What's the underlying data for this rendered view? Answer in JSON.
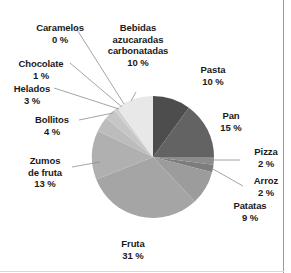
{
  "chart_data": {
    "type": "pie",
    "title": "",
    "subtitle": "",
    "xlabel": "",
    "ylabel": "",
    "legend_position": "none",
    "grid": false,
    "units": "%",
    "start_angle_deg": 0,
    "direction": "clockwise",
    "categories": [
      "Pasta",
      "Pan",
      "Pizza",
      "Arroz",
      "Patatas",
      "Fruta",
      "Zumos de fruta",
      "Bollitos",
      "Helados",
      "Chocolate",
      "Caramelos",
      "Bebidas azucaradas carbonatadas"
    ],
    "values": [
      10,
      15,
      2,
      2,
      9,
      31,
      13,
      4,
      3,
      1,
      0,
      10
    ],
    "colors": [
      "#4d4d4d",
      "#636363",
      "#8c8c8c",
      "#7d7d7d",
      "#9c9c9c",
      "#a5a5a5",
      "#b0b0b0",
      "#bcbcbc",
      "#c6c6c6",
      "#d0d0d0",
      "#dcdcdc",
      "#e8e8e8"
    ],
    "slices": [
      {
        "label": "Pasta",
        "value": 10,
        "display": "10 %",
        "color": "#4d4d4d"
      },
      {
        "label": "Pan",
        "value": 15,
        "display": "15 %",
        "color": "#636363"
      },
      {
        "label": "Pizza",
        "value": 2,
        "display": "2 %",
        "color": "#8c8c8c"
      },
      {
        "label": "Arroz",
        "value": 2,
        "display": "2 %",
        "color": "#7d7d7d"
      },
      {
        "label": "Patatas",
        "value": 9,
        "display": "9 %",
        "color": "#9c9c9c"
      },
      {
        "label": "Fruta",
        "value": 31,
        "display": "31 %",
        "color": "#a5a5a5"
      },
      {
        "label": "Zumos de fruta",
        "value": 13,
        "display": "13 %",
        "color": "#b0b0b0"
      },
      {
        "label": "Bollitos",
        "value": 4,
        "display": "4 %",
        "color": "#bcbcbc"
      },
      {
        "label": "Helados",
        "value": 3,
        "display": "3 %",
        "color": "#c6c6c6"
      },
      {
        "label": "Chocolate",
        "value": 1,
        "display": "1 %",
        "color": "#d0d0d0"
      },
      {
        "label": "Caramelos",
        "value": 0,
        "display": "0 %",
        "color": "#dcdcdc"
      },
      {
        "label": "Bebidas azucaradas carbonatadas",
        "value": 10,
        "display": "10 %",
        "color": "#e8e8e8"
      }
    ]
  },
  "labels": {
    "caramelos": {
      "name": "Caramelos",
      "pct": "0 %"
    },
    "bebidas": {
      "l1": "Bebidas",
      "l2": "azucaradas",
      "l3": "carbonatadas",
      "pct": "10 %"
    },
    "pasta": {
      "name": "Pasta",
      "pct": "10 %"
    },
    "chocolate": {
      "name": "Chocolate",
      "pct": "1 %"
    },
    "helados": {
      "name": "Helados",
      "pct": "3 %"
    },
    "pan": {
      "name": "Pan",
      "pct": "15 %"
    },
    "bollitos": {
      "name": "Bollitos",
      "pct": "4 %"
    },
    "pizza": {
      "name": "Pizza",
      "pct": "2 %"
    },
    "arroz": {
      "name": "Arroz",
      "pct": "2 %"
    },
    "patatas": {
      "name": "Patatas",
      "pct": "9 %"
    },
    "zumos": {
      "l1": "Zumos",
      "l2": "de fruta",
      "pct": "13 %"
    },
    "fruta": {
      "name": "Fruta",
      "pct": "31 %"
    }
  }
}
